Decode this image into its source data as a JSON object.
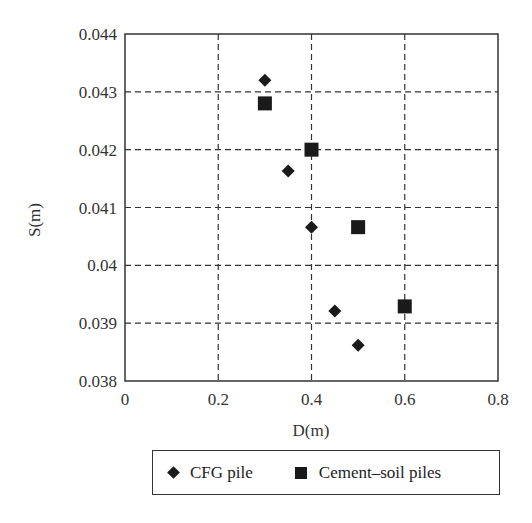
{
  "chart_data": {
    "type": "scatter",
    "title": "",
    "xlabel": "D(m)",
    "ylabel": "S(m)",
    "xlim": [
      0,
      0.8
    ],
    "ylim": [
      0.038,
      0.044
    ],
    "xticks": [
      "0",
      "0.2",
      "0.4",
      "0.6",
      "0.8"
    ],
    "yticks": [
      "0.038",
      "0.039",
      "0.04",
      "0.041",
      "0.042",
      "0.043",
      "0.044"
    ],
    "grid": "dashed",
    "legend_position": "below",
    "series": [
      {
        "name": "CFG pile",
        "marker": "diamond",
        "color": "#1a1a1a",
        "x": [
          0.3,
          0.35,
          0.4,
          0.45,
          0.5
        ],
        "y": [
          0.0432,
          0.04163,
          0.04066,
          0.03921,
          0.03862
        ]
      },
      {
        "name": "Cement–soil piles",
        "marker": "square",
        "color": "#1a1a1a",
        "x": [
          0.3,
          0.4,
          0.5,
          0.6
        ],
        "y": [
          0.0428,
          0.042,
          0.04066,
          0.03929
        ]
      }
    ]
  },
  "legend": {
    "items": [
      {
        "label": "CFG pile"
      },
      {
        "label": "Cement–soil piles"
      }
    ]
  }
}
